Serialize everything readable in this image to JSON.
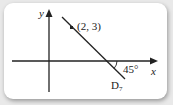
{
  "diagram": {
    "axes": {
      "x_label": "x",
      "y_label": "y"
    },
    "point": {
      "label": "(2, 3)",
      "x": 2,
      "y": 3
    },
    "line": {
      "name": "D",
      "subscript": "7",
      "angle_label": "45°",
      "slope": -1
    },
    "colors": {
      "stroke": "#222222",
      "background": "#ffffff"
    }
  }
}
